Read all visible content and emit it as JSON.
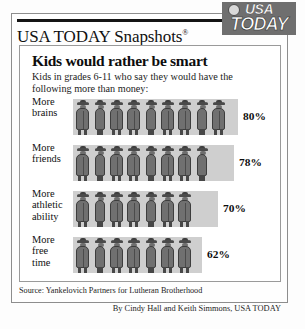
{
  "masthead": {
    "title": "USA TODAY Snapshots",
    "registered_mark": "®",
    "logo_line1": "USA",
    "logo_line2": "TODAY",
    "logo_bg": "#6f6f6f"
  },
  "chart_data": {
    "type": "bar",
    "title": "Kids would rather be smart",
    "subtitle": "Kids in grades 6-11 who say they would have the following more than money:",
    "categories": [
      "More brains",
      "More friends",
      "More athletic ability",
      "More free time"
    ],
    "values": [
      80,
      78,
      70,
      62
    ],
    "value_labels": [
      "80%",
      "78%",
      "70%",
      "62%"
    ],
    "unit": "%",
    "xlabel": "",
    "ylabel": "",
    "ylim": [
      0,
      100
    ],
    "grid": false,
    "legend": "none",
    "pictogram_icon": "person-in-hat-and-coat-icon",
    "pictogram_counts": [
      9,
      8,
      7,
      7
    ],
    "band_color": "#cfcfcf",
    "figure_color": "#707070",
    "source": "Source: Yankelovich Partners for Lutheran Brotherhood",
    "byline": "By Cindy Hall and Keith Simmons, USA TODAY"
  },
  "rows": [
    {
      "label_line1": "More",
      "label_line2": "brains",
      "label_line3": "",
      "value": "80%",
      "figures": 9,
      "bar_width": 165,
      "value_x": 223
    },
    {
      "label_line1": "More",
      "label_line2": "friends",
      "label_line3": "",
      "value": "78%",
      "figures": 8,
      "bar_width": 161,
      "value_x": 219
    },
    {
      "label_line1": "More",
      "label_line2": "athletic",
      "label_line3": "ability",
      "value": "70%",
      "figures": 7,
      "bar_width": 145,
      "value_x": 203
    },
    {
      "label_line1": "More",
      "label_line2": "free",
      "label_line3": "time",
      "value": "62%",
      "figures": 7,
      "bar_width": 129,
      "value_x": 187
    }
  ]
}
